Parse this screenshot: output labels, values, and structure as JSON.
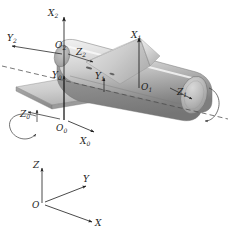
{
  "figure": {
    "background_color": "#ffffff",
    "stroke_color": "#1c1c1c",
    "dash_color": "#4a4a4a"
  },
  "palette": {
    "cylinder_light": "#e9e9e9",
    "cylinder_mid": "#c9c9c9",
    "cylinder_dark": "#9a9a9a",
    "cylinder_darkest": "#7c7c7c",
    "wedge_light": "#dedede",
    "wedge_mid": "#bdbdbd",
    "wedge_dark": "#a2a2a2",
    "plate_top": "#d4d4d4",
    "plate_side": "#8f8f8f",
    "endcap": "#b0b0b0",
    "outline": "#6e6e6e"
  },
  "frames": {
    "frame0": {
      "name": "base-frame",
      "origin": {
        "label": "O",
        "subscript": "0"
      },
      "x_axis": {
        "label": "X",
        "subscript": "0"
      },
      "y_axis": {
        "label": "Y",
        "subscript": "0"
      },
      "z_axis": {
        "label": "Z",
        "subscript": "0"
      }
    },
    "frame1": {
      "name": "link1-frame",
      "origin": {
        "label": "O",
        "subscript": "1"
      },
      "x_axis": {
        "label": "X",
        "subscript": "1"
      },
      "y_axis": {
        "label": "Y",
        "subscript": "1"
      },
      "z_axis": {
        "label": "Z",
        "subscript": "1"
      }
    },
    "frame2": {
      "name": "link2-frame",
      "origin": {
        "label": "O",
        "subscript": "2"
      },
      "x_axis": {
        "label": "X",
        "subscript": "2"
      },
      "y_axis": {
        "label": "Y",
        "subscript": "2"
      },
      "z_axis": {
        "label": "Z",
        "subscript": "2"
      }
    },
    "reference": {
      "name": "reference-triad",
      "origin": {
        "label": "O",
        "subscript": ""
      },
      "x_axis": {
        "label": "X",
        "subscript": ""
      },
      "y_axis": {
        "label": "Y",
        "subscript": ""
      },
      "z_axis": {
        "label": "Z",
        "subscript": ""
      }
    }
  },
  "annotations": {
    "rotation_arrow_left": "rotation-arrow-about-z0",
    "rotation_arrow_right": "rotation-arrow-about-z1",
    "dashed_axis": "rotation-axis-dashed-line"
  }
}
